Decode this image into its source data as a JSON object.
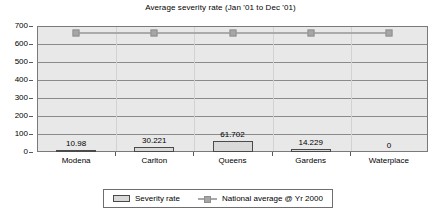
{
  "chart_data": {
    "type": "bar",
    "title": "Average severity rate (Jan '01 to Dec '01)",
    "xlabel": "",
    "ylabel": "",
    "ylim": [
      0,
      700
    ],
    "yticks": [
      0,
      100,
      200,
      300,
      400,
      500,
      600,
      700
    ],
    "ytick_labels": [
      "0",
      "100",
      "200",
      "300",
      "400",
      "500",
      "600",
      "700"
    ],
    "grid": true,
    "legend_position": "bottom",
    "categories": [
      "Modena",
      "Carlton",
      "Queens",
      "Gardens",
      "Waterplace"
    ],
    "series": [
      {
        "name": "Severity rate",
        "kind": "bar",
        "values": [
          10.98,
          30.221,
          61.702,
          14.229,
          0
        ],
        "data_labels": [
          "10.98",
          "30.221",
          "61.702",
          "14.229",
          "0"
        ],
        "fill_color": "#d9d9d9",
        "border_color": "#4a4a4a"
      },
      {
        "name": "National average @ Yr 2000",
        "kind": "line",
        "values": [
          660,
          660,
          660,
          660,
          660
        ],
        "line_color": "#aaaaaa",
        "marker_color": "#a6a6a6"
      }
    ],
    "plot_background": "#e8e8e8"
  },
  "legend": {
    "items": [
      {
        "label": "Severity rate"
      },
      {
        "label": "National average @ Yr 2000"
      }
    ]
  }
}
